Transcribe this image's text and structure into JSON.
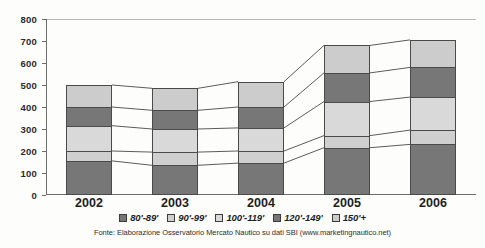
{
  "chart_data": {
    "type": "bar",
    "stacked": true,
    "title": "",
    "subtitle": "",
    "xlabel": "",
    "ylabel": "",
    "categories": [
      "2002",
      "2003",
      "2004",
      "2005",
      "2006"
    ],
    "ylim": [
      0,
      800
    ],
    "ytick_values": [
      0,
      100,
      200,
      300,
      400,
      500,
      600,
      700,
      800
    ],
    "ytick_labels": [
      "0",
      "100",
      "200",
      "300",
      "400",
      "500",
      "600",
      "700",
      "800"
    ],
    "grid": false,
    "legend_position": "bottom",
    "series": [
      {
        "name": "80'-89'",
        "color": "#777777",
        "values": [
          155,
          135,
          145,
          215,
          230
        ]
      },
      {
        "name": "90'-99'",
        "color": "#cfcfcf",
        "values": [
          45,
          60,
          55,
          55,
          65
        ]
      },
      {
        "name": "100'-119'",
        "color": "#d9d9d9",
        "values": [
          115,
          105,
          105,
          155,
          150
        ]
      },
      {
        "name": "120'-149'",
        "color": "#777777",
        "values": [
          85,
          85,
          95,
          130,
          135
        ]
      },
      {
        "name": "150'+",
        "color": "#cccccc",
        "values": [
          100,
          100,
          115,
          125,
          125
        ]
      }
    ],
    "totals": [
      500,
      485,
      515,
      680,
      705
    ],
    "annotations": []
  },
  "source": {
    "note": "Fonte: Elaborazione Osservatorio Mercato Nautico su dati SBI (www.marketingnautico.net)"
  },
  "colors": {
    "dark_gray": "#777777",
    "mid_gray": "#cfcfcf",
    "light_gray": "#d9d9d9",
    "legend_gray": "#cccccc",
    "axis": "#6d6d6d",
    "outline": "#4a4a4a",
    "background": "#fdfdfb"
  }
}
